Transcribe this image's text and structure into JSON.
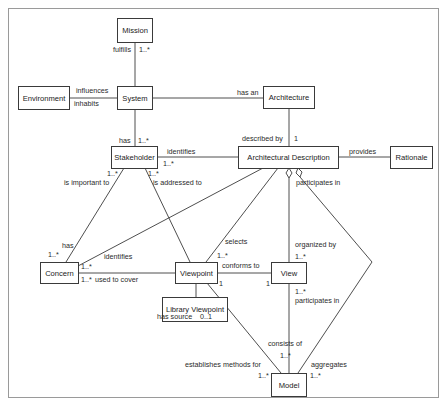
{
  "diagram": {
    "type": "UML class diagram",
    "classes": {
      "mission": "Mission",
      "environment": "Environment",
      "system": "System",
      "architecture": "Architecture",
      "stakeholder": "Stakeholder",
      "architectural_description": "Architectural Description",
      "rationale": "Rationale",
      "concern": "Concern",
      "viewpoint": "Viewpoint",
      "view": "View",
      "library_viewpoint": "Library Viewpoint",
      "model": "Model"
    },
    "associations": [
      {
        "from": "System",
        "to": "Mission",
        "label": "fulfills",
        "multiplicity": "1..*"
      },
      {
        "from": "Environment",
        "to": "System",
        "label_top": "influences",
        "label_bottom": "inhabits"
      },
      {
        "from": "System",
        "to": "Architecture",
        "label": "has an"
      },
      {
        "from": "System",
        "to": "Stakeholder",
        "label": "has",
        "multiplicity": "1..*"
      },
      {
        "from": "Architecture",
        "to": "Architectural Description",
        "label": "described by",
        "multiplicity": "1"
      },
      {
        "from": "Architectural Description",
        "to": "Stakeholder",
        "label": "identifies",
        "multiplicity": "1..*"
      },
      {
        "from": "Architectural Description",
        "to": "Rationale",
        "label": "provides"
      },
      {
        "from": "Stakeholder",
        "to": "Concern",
        "label": "is important to",
        "multiplicity": "1..*",
        "label_end": "has",
        "multiplicity_end": "1..*"
      },
      {
        "from": "Stakeholder",
        "to": "Viewpoint",
        "label": "is addressed to",
        "multiplicity": "1..*"
      },
      {
        "from": "Architectural Description",
        "to": "Concern",
        "label": "identifies",
        "multiplicity": "1..*"
      },
      {
        "from": "Architectural Description",
        "to": "Viewpoint",
        "label": "selects",
        "multiplicity": "1..*"
      },
      {
        "from": "Architectural Description",
        "to": "View",
        "label": "organized by",
        "multiplicity": "1..*",
        "aggregation": true
      },
      {
        "from": "Architectural Description",
        "to": "Model",
        "label": "participates in",
        "aggregation": true
      },
      {
        "from": "Viewpoint",
        "to": "Concern",
        "label": "used to cover",
        "multiplicity": "1..*"
      },
      {
        "from": "View",
        "to": "Viewpoint",
        "label": "conforms to",
        "multiplicity_vp": "1",
        "multiplicity_view": "1"
      },
      {
        "from": "Viewpoint",
        "to": "Library Viewpoint",
        "label": "has source",
        "multiplicity": "0..1"
      },
      {
        "from": "Viewpoint",
        "to": "Model",
        "label": "establishes methods for",
        "multiplicity": "1..*"
      },
      {
        "from": "View",
        "to": "Model",
        "label": "consists of",
        "multiplicity": "1..*",
        "label_view": "participates in",
        "multiplicity_view": "1..*"
      },
      {
        "from": "Model",
        "to": "Architectural Description",
        "label": "aggregates",
        "multiplicity": "1..*"
      }
    ]
  },
  "labels": {
    "fulfills": "fulfills",
    "fulfills_mult": "1..*",
    "influences": "influences",
    "inhabits": "inhabits",
    "has_an": "has an",
    "has": "has",
    "has_mult": "1..*",
    "described_by": "described by",
    "described_by_mult": "1",
    "identifies_sh": "identifies",
    "identifies_sh_mult": "1..*",
    "provides": "provides",
    "is_important_to": "is important to",
    "is_important_to_mult": "1..*",
    "is_addressed_to": "is addressed to",
    "is_addressed_to_mult": "1..*",
    "participates_in_ad": "participates in",
    "concern_has": "has",
    "concern_has_mult": "1..*",
    "identifies_concern": "identifies",
    "selects": "selects",
    "selects_mult": "1..*",
    "organized_by": "organized by",
    "organized_by_mult": "1..*",
    "concern_mult_top": "1..*",
    "concern_mult_bottom": "1..*",
    "used_to_cover": "used to cover",
    "conforms_to": "conforms to",
    "vp_mult_1": "1",
    "view_mult_1": "1",
    "has_source": "has source",
    "has_source_mult": "0..1",
    "view_part_mult": "1..*",
    "participates_in_view": "participates in",
    "consists_of": "consists of",
    "consists_of_mult": "1..*",
    "establishes_methods_for": "establishes methods for",
    "establishes_mult": "1..*",
    "aggregates": "aggregates",
    "aggregates_mult": "1..*"
  }
}
